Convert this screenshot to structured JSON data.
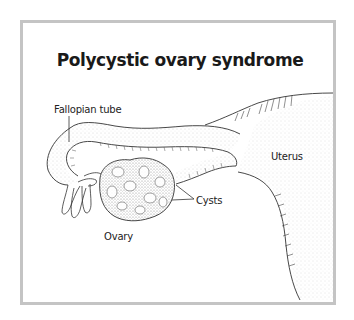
{
  "diagram": {
    "title": "Polycystic ovary syndrome",
    "labels": {
      "fallopian_tube": "Fallopian tube",
      "uterus": "Uterus",
      "cysts": "Cysts",
      "ovary": "Ovary"
    },
    "colors": {
      "frame_border": "#c4c4c4",
      "line": "#333333",
      "stipple": "#8a8a8a",
      "text": "#222222"
    }
  }
}
